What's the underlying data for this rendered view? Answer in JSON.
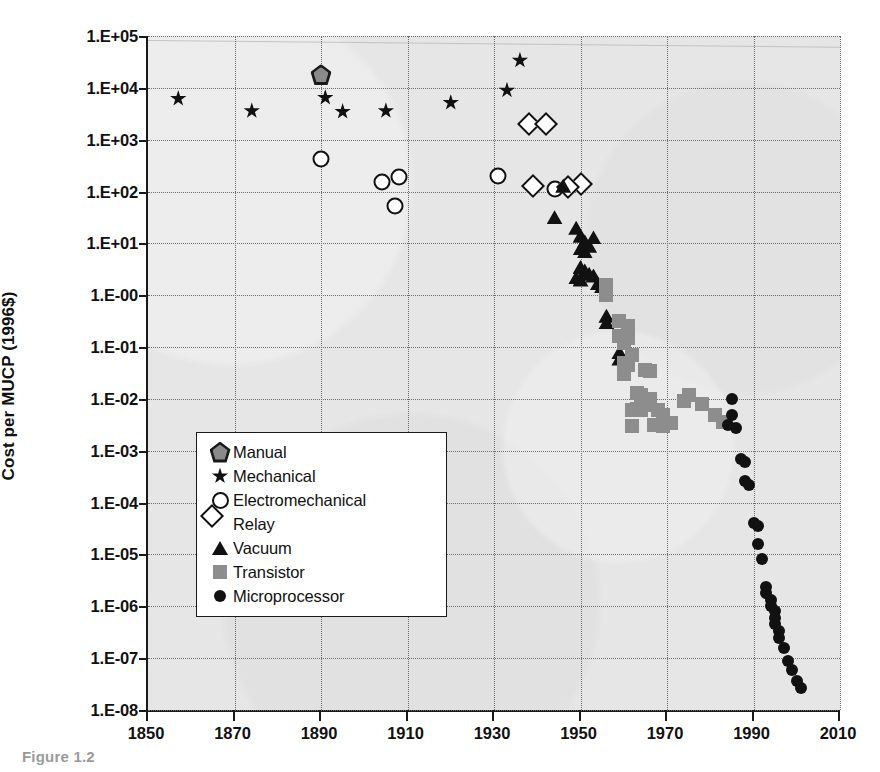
{
  "figure": {
    "caption": "Figure 1.2",
    "y_axis_title": "Cost per MUCP (1996$)"
  },
  "chart_data": {
    "type": "scatter",
    "title": "",
    "xlabel": "",
    "ylabel": "Cost per MUCP (1996$)",
    "xlim": [
      1850,
      2010
    ],
    "ylim": [
      1e-08,
      100000.0
    ],
    "yscale": "log",
    "grid": true,
    "legend_position": "center-left",
    "x_ticks": [
      "1850",
      "1870",
      "1890",
      "1910",
      "1930",
      "1950",
      "1970",
      "1990",
      "2010"
    ],
    "x_tick_values": [
      1850,
      1870,
      1890,
      1910,
      1930,
      1950,
      1970,
      1990,
      2010
    ],
    "y_ticks": [
      "1.E+05",
      "1.E+04",
      "1.E+03",
      "1.E+02",
      "1.E+01",
      "1.E-00",
      "1.E-01",
      "1.E-02",
      "1.E-03",
      "1.E-04",
      "1.E-05",
      "1.E-06",
      "1.E-07",
      "1.E-08"
    ],
    "y_tick_values": [
      100000.0,
      10000.0,
      1000.0,
      100.0,
      10.0,
      1.0,
      0.1,
      0.01,
      0.001,
      0.0001,
      1e-05,
      1e-06,
      1e-07,
      1e-08
    ],
    "series": [
      {
        "name": "Manual",
        "marker": "pentagon",
        "color": "#8a8a8a",
        "edge": "#1a1a1a",
        "points": [
          [
            1890,
            18000.0
          ]
        ]
      },
      {
        "name": "Mechanical",
        "marker": "star",
        "color": "#111111",
        "points": [
          [
            1857,
            6200.0
          ],
          [
            1874,
            3600.0
          ],
          [
            1891,
            6500.0
          ],
          [
            1895,
            3500.0
          ],
          [
            1905,
            3600.0
          ],
          [
            1920,
            5200.0
          ],
          [
            1933,
            9000.0
          ],
          [
            1936,
            34000.0
          ]
        ]
      },
      {
        "name": "Electromechanical",
        "marker": "circle-open",
        "color": "#ffffff",
        "edge": "#111111",
        "points": [
          [
            1890,
            430.0
          ],
          [
            1904,
            150.0
          ],
          [
            1908,
            190.0
          ],
          [
            1907,
            52.0
          ],
          [
            1931,
            200.0
          ],
          [
            1944,
            110.0
          ]
        ]
      },
      {
        "name": "Relay",
        "marker": "diamond-open",
        "color": "#ffffff",
        "edge": "#111111",
        "points": [
          [
            1938,
            2000.0
          ],
          [
            1942,
            2000.0
          ],
          [
            1939,
            130.0
          ],
          [
            1950,
            140.0
          ],
          [
            1947,
            120.0
          ]
        ]
      },
      {
        "name": "Vacuum",
        "marker": "triangle",
        "color": "#111111",
        "points": [
          [
            1946,
            130.0
          ],
          [
            1944,
            32.0
          ],
          [
            1949,
            20.0
          ],
          [
            1950,
            14.0
          ],
          [
            1951,
            11.0
          ],
          [
            1952,
            9.0
          ],
          [
            1950,
            8.0
          ],
          [
            1953,
            13.0
          ],
          [
            1951,
            7.0
          ],
          [
            1950,
            3.5
          ],
          [
            1951,
            3.0
          ],
          [
            1952,
            2.6
          ],
          [
            1949,
            2.2
          ],
          [
            1950,
            2.0
          ],
          [
            1953,
            2.4
          ],
          [
            1954,
            1.7
          ],
          [
            1955,
            1.5
          ],
          [
            1956,
            0.4
          ],
          [
            1956,
            0.3
          ],
          [
            1959,
            0.08
          ],
          [
            1959,
            0.06
          ]
        ]
      },
      {
        "name": "Transistor",
        "marker": "square",
        "color": "#8d8d8d",
        "points": [
          [
            1956,
            1.6
          ],
          [
            1956,
            1.0
          ],
          [
            1959,
            0.32
          ],
          [
            1961,
            0.26
          ],
          [
            1959,
            0.16
          ],
          [
            1961,
            0.15
          ],
          [
            1960,
            0.12
          ],
          [
            1962,
            0.07
          ],
          [
            1960,
            0.05
          ],
          [
            1961,
            0.045
          ],
          [
            1960,
            0.03
          ],
          [
            1965,
            0.036
          ],
          [
            1966,
            0.034
          ],
          [
            1963,
            0.013
          ],
          [
            1964,
            0.012
          ],
          [
            1966,
            0.01
          ],
          [
            1962,
            0.006
          ],
          [
            1963,
            0.0065
          ],
          [
            1964,
            0.0062
          ],
          [
            1966,
            0.0075
          ],
          [
            1968,
            0.006
          ],
          [
            1969,
            0.005
          ],
          [
            1962,
            0.003
          ],
          [
            1967,
            0.0032
          ],
          [
            1969,
            0.003
          ],
          [
            1971,
            0.0034
          ],
          [
            1974,
            0.009
          ],
          [
            1975,
            0.012
          ],
          [
            1978,
            0.008
          ],
          [
            1981,
            0.005
          ],
          [
            1983,
            0.0036
          ]
        ]
      },
      {
        "name": "Microprocessor",
        "marker": "circle-filled",
        "color": "#111111",
        "points": [
          [
            1985,
            0.01
          ],
          [
            1985,
            0.005
          ],
          [
            1984,
            0.0032
          ],
          [
            1986,
            0.0028
          ],
          [
            1987,
            0.0007
          ],
          [
            1988,
            0.0006
          ],
          [
            1988,
            0.00026
          ],
          [
            1989,
            0.00022
          ],
          [
            1990,
            4e-05
          ],
          [
            1991,
            3.6e-05
          ],
          [
            1991,
            1.6e-05
          ],
          [
            1992,
            8e-06
          ],
          [
            1993,
            2.4e-06
          ],
          [
            1993,
            1.8e-06
          ],
          [
            1994,
            1.3e-06
          ],
          [
            1994,
            1e-06
          ],
          [
            1995,
            8e-07
          ],
          [
            1995,
            6e-07
          ],
          [
            1995,
            4.5e-07
          ],
          [
            1996,
            3.4e-07
          ],
          [
            1996,
            2.4e-07
          ],
          [
            1997,
            1.6e-07
          ],
          [
            1998,
            9e-08
          ],
          [
            1999,
            6e-08
          ],
          [
            2000,
            3.6e-08
          ],
          [
            2001,
            2.6e-08
          ]
        ]
      }
    ]
  }
}
